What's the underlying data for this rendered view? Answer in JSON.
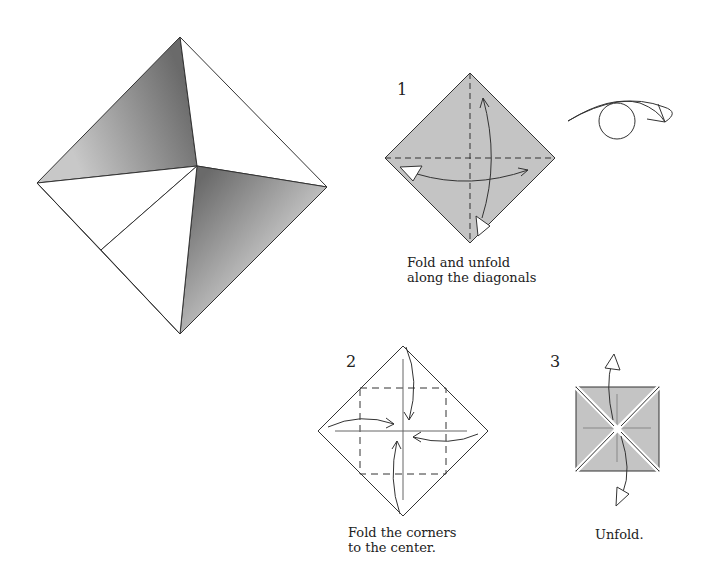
{
  "diagram": {
    "steps": [
      {
        "number": "1",
        "caption_line1": "Fold and unfold",
        "caption_line2": "along the diagonals"
      },
      {
        "number": "2",
        "caption_line1": "Fold the corners",
        "caption_line2": "to the center."
      },
      {
        "number": "3",
        "caption_line1": "Unfold.",
        "caption_line2": ""
      }
    ],
    "colors": {
      "paper_gray": "#c4c4c4",
      "shade_dark": "#6e6e6e",
      "shade_light": "#d8d8d8",
      "line": "#222222",
      "background": "#ffffff"
    },
    "icons": [
      "finished-model",
      "turn-over-icon",
      "valley-fold-arrow",
      "unfold-arrow"
    ]
  }
}
